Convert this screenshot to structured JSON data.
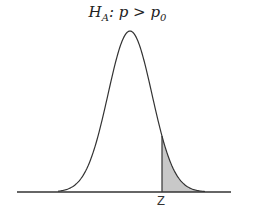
{
  "title": {
    "h": "H",
    "sub_a": "A",
    "mid": ": p > p",
    "sub_0": "0"
  },
  "z_label": "Z",
  "chart_data": {
    "type": "area",
    "curve": "normal",
    "shaded_region": "right tail, x > z",
    "annotations": [
      "Z"
    ],
    "colors": {
      "curve": "#333333",
      "shade": "#c8c8c8",
      "axis": "#333333"
    }
  }
}
